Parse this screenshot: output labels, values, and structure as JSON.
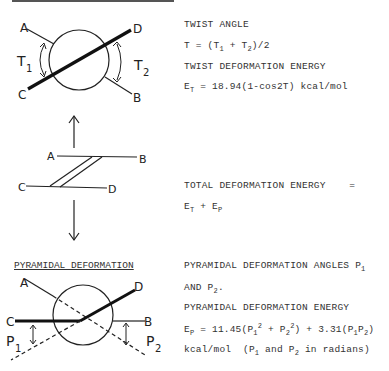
{
  "twist": {
    "diagram_labels": {
      "A": "A",
      "B": "B",
      "C": "C",
      "D": "D",
      "T1_main": "T",
      "T1_sub": "1",
      "T2_main": "T",
      "T2_sub": "2"
    },
    "text": {
      "line1": "TWIST ANGLE",
      "line2_prefix": "T = (T",
      "line2_sub1": "1",
      "line2_mid": " + T",
      "line2_sub2": "2",
      "line2_suffix": ")/2",
      "line3": "TWIST DEFORMATION ENERGY",
      "line4_prefix": "E",
      "line4_sub": "T",
      "line4_suffix": " = 18.94(1-cos2T) kcal/mol"
    }
  },
  "side_view": {
    "diagram_labels": {
      "A": "A",
      "B": "B",
      "C": "C",
      "D": "D"
    }
  },
  "total": {
    "line1": "TOTAL DEFORMATION ENERGY    =",
    "line2_e1": "E",
    "line2_sub1": "T",
    "line2_plus": " + E",
    "line2_sub2": "P"
  },
  "pyramidal": {
    "heading": "PYRAMIDAL DEFORMATION",
    "diagram_labels": {
      "A": "A",
      "B": "B",
      "C": "C",
      "D": "D",
      "P1_main": "P",
      "P1_sub": "1",
      "P2_main": "P",
      "P2_sub": "2"
    },
    "text": {
      "line1_prefix": "PYRAMIDAL DEFORMATION ANGLES P",
      "line1_sub": "1",
      "line2_prefix": "AND P",
      "line2_sub": "2",
      "line2_suffix": ".",
      "line3": "PYRAMIDAL DEFORMATION ENERGY",
      "line4_e": "E",
      "line4_esub": "P",
      "line4_a": " = 11.45(P",
      "line4_s1": "1",
      "line4_sup1": "2",
      "line4_b": " + P",
      "line4_s2": "2",
      "line4_sup2": "2",
      "line4_c": ") + 3.31(P",
      "line4_s3": "1",
      "line4_d": "P",
      "line4_s4": "2",
      "line4_e_end": ")",
      "line5_a": "kcal/mol  (P",
      "line5_s1": "1",
      "line5_b": " and P",
      "line5_s2": "2",
      "line5_c": " in radians)"
    }
  }
}
